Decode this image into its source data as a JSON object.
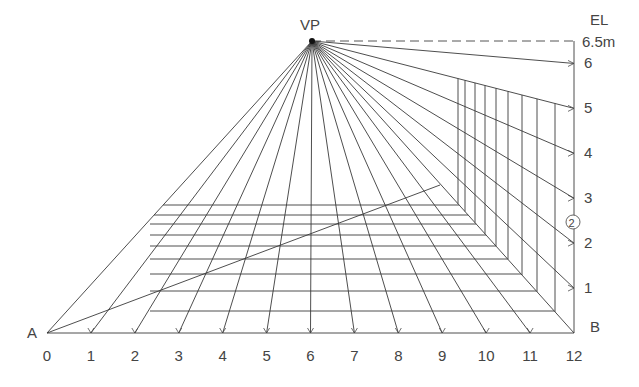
{
  "diagram": {
    "labels": {
      "vanishing_point": "VP",
      "eye_level": "EL",
      "corner_left": "A",
      "corner_right": "B",
      "height_marker": "6.5m",
      "circled_note": "2"
    },
    "x_axis": {
      "ticks": [
        "0",
        "1",
        "2",
        "3",
        "4",
        "5",
        "6",
        "7",
        "8",
        "9",
        "10",
        "11",
        "12"
      ]
    },
    "y_axis": {
      "ticks": [
        "1",
        "2",
        "3",
        "4",
        "5",
        "6"
      ],
      "top_label": "6.5m"
    },
    "colors": {
      "line": "#3a3a3a",
      "text": "#444444",
      "background": "#ffffff"
    }
  }
}
